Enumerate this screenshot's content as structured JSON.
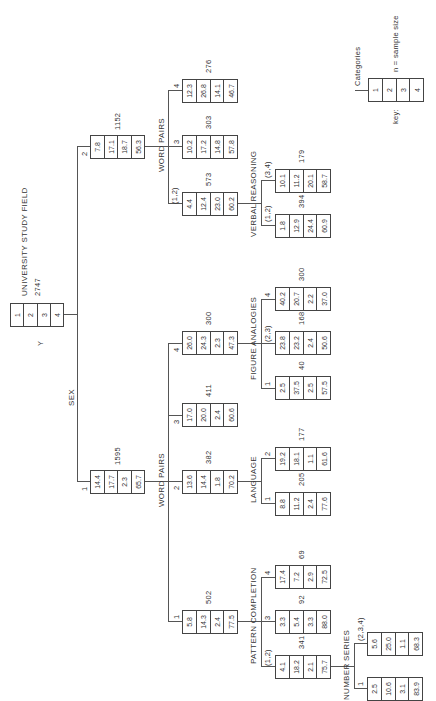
{
  "root": {
    "title": "UNIVERSITY STUDY FIELD",
    "n": "2747",
    "var": "Y",
    "cells": [
      "1",
      "2",
      "3",
      "4"
    ]
  },
  "split_root": "SEX",
  "key": {
    "label": "key:",
    "title": "Categories",
    "n_note": "n  =  sample size",
    "cells": [
      "1",
      "2",
      "3",
      "4"
    ]
  },
  "nodes": {
    "sex2": {
      "branch": "2",
      "n": "1152",
      "cells": [
        "7.8",
        "17.1",
        "18.7",
        "56.3"
      ],
      "split": "WORD PAIRS"
    },
    "s2wp12": {
      "branch": "(1,2)",
      "n": "573",
      "cells": [
        "4.4",
        "12.4",
        "23.0",
        "60.2"
      ],
      "split": "VERBAL REASONING"
    },
    "s2wp3": {
      "branch": "3",
      "n": "303",
      "cells": [
        "10.2",
        "17.2",
        "14.8",
        "57.8"
      ]
    },
    "s2wp4": {
      "branch": "4",
      "n": "276",
      "cells": [
        "12.3",
        "26.8",
        "14.1",
        "46.7"
      ]
    },
    "vr12": {
      "branch": "(1,2)",
      "n": "394",
      "cells": [
        "1.8",
        "12.9",
        "24.4",
        "60.9"
      ]
    },
    "vr34": {
      "branch": "(3,4)",
      "n": "179",
      "cells": [
        "10.1",
        "11.2",
        "20.1",
        "58.7"
      ]
    },
    "sex1": {
      "branch": "1",
      "n": "1595",
      "cells": [
        "14.4",
        "17.7",
        "2.3",
        "65.7"
      ],
      "split": "WORD PAIRS"
    },
    "s1wp1": {
      "branch": "1",
      "n": "502",
      "cells": [
        "5.8",
        "14.3",
        "2.4",
        "77.5"
      ],
      "split": "PATTERN COMPLETION"
    },
    "s1wp2": {
      "branch": "2",
      "n": "382",
      "cells": [
        "13.6",
        "14.4",
        "1.8",
        "70.2"
      ],
      "split": "LANGUAGE"
    },
    "s1wp3": {
      "branch": "3",
      "n": "411",
      "cells": [
        "17.0",
        "20.0",
        "2.4",
        "60.6"
      ]
    },
    "s1wp4": {
      "branch": "4",
      "n": "300",
      "cells": [
        "26.0",
        "24.3",
        "2.3",
        "47.3"
      ],
      "split": "FIGURE ANALOGIES"
    },
    "fa1": {
      "branch": "1",
      "n": "40",
      "cells": [
        "2.5",
        "37.5",
        "2.5",
        "57.5"
      ]
    },
    "fa23": {
      "branch": "(2,3)",
      "n": "168",
      "cells": [
        "23.8",
        "23.2",
        "2.4",
        "50.6"
      ]
    },
    "fa4": {
      "branch": "4",
      "n": "300",
      "cells": [
        "40.2",
        "20.7",
        "2.2",
        "37.0"
      ]
    },
    "lang1": {
      "branch": "1",
      "n": "205",
      "cells": [
        "8.8",
        "11.2",
        "2.4",
        "77.6"
      ]
    },
    "lang2": {
      "branch": "2",
      "n": "177",
      "cells": [
        "19.2",
        "18.1",
        "1.1",
        "61.6"
      ]
    },
    "pc12": {
      "branch": "(1,2)",
      "n": "341",
      "cells": [
        "4.1",
        "18.2",
        "2.1",
        "75.7"
      ],
      "split": "NUMBER SERIES"
    },
    "pc3": {
      "branch": "3",
      "n": "92",
      "cells": [
        "3.3",
        "5.4",
        "3.3",
        "88.0"
      ]
    },
    "pc4": {
      "branch": "4",
      "n": "69",
      "cells": [
        "17.4",
        "7.2",
        "2.9",
        "72.5"
      ]
    },
    "ns1": {
      "branch": "1",
      "n": "",
      "cells": [
        "2.5",
        "10.6",
        "3.1",
        "83.9"
      ]
    },
    "ns234": {
      "branch": "(2,3,4)",
      "n": "",
      "cells": [
        "5.6",
        "25.0",
        "1.1",
        "68.3"
      ]
    }
  }
}
